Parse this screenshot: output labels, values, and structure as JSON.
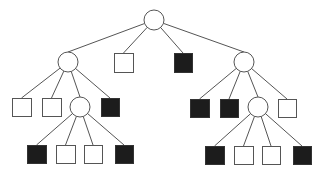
{
  "diagram": {
    "type": "tree",
    "colors": {
      "line": "#555555",
      "filled": "#1c1c1c",
      "empty": "#ffffff"
    },
    "nodes": [
      {
        "id": "root",
        "shape": "circle",
        "fill": "white",
        "cx": 154,
        "cy": 20,
        "r": 10
      },
      {
        "id": "L1a",
        "parent": "root",
        "shape": "circle",
        "fill": "white",
        "cx": 68,
        "cy": 62,
        "r": 10
      },
      {
        "id": "L1b",
        "parent": "root",
        "shape": "square",
        "fill": "white",
        "x": 114,
        "y": 53,
        "w": 19,
        "h": 19
      },
      {
        "id": "L1c",
        "parent": "root",
        "shape": "square",
        "fill": "black",
        "x": 174,
        "y": 53,
        "w": 18,
        "h": 19
      },
      {
        "id": "L1d",
        "parent": "root",
        "shape": "circle",
        "fill": "white",
        "cx": 244,
        "cy": 62,
        "r": 10
      },
      {
        "id": "L2a",
        "parent": "L1a",
        "shape": "square",
        "fill": "white",
        "x": 12,
        "y": 98,
        "w": 19,
        "h": 18
      },
      {
        "id": "L2b",
        "parent": "L1a",
        "shape": "square",
        "fill": "white",
        "x": 42,
        "y": 98,
        "w": 19,
        "h": 18
      },
      {
        "id": "L2c",
        "parent": "L1a",
        "shape": "circle",
        "fill": "white",
        "cx": 80,
        "cy": 107,
        "r": 10
      },
      {
        "id": "L2d",
        "parent": "L1a",
        "shape": "square",
        "fill": "black",
        "x": 101,
        "y": 98,
        "w": 18,
        "h": 18
      },
      {
        "id": "L2e",
        "parent": "L1d",
        "shape": "square",
        "fill": "black",
        "x": 190,
        "y": 99,
        "w": 19,
        "h": 18
      },
      {
        "id": "L2f",
        "parent": "L1d",
        "shape": "square",
        "fill": "black",
        "x": 220,
        "y": 99,
        "w": 18,
        "h": 18
      },
      {
        "id": "L2g",
        "parent": "L1d",
        "shape": "circle",
        "fill": "white",
        "cx": 258,
        "cy": 107,
        "r": 10
      },
      {
        "id": "L2h",
        "parent": "L1d",
        "shape": "square",
        "fill": "white",
        "x": 278,
        "y": 99,
        "w": 18,
        "h": 18
      },
      {
        "id": "L3a",
        "parent": "L2c",
        "shape": "square",
        "fill": "black",
        "x": 27,
        "y": 145,
        "w": 19,
        "h": 18
      },
      {
        "id": "L3b",
        "parent": "L2c",
        "shape": "square",
        "fill": "white",
        "x": 56,
        "y": 145,
        "w": 19,
        "h": 18
      },
      {
        "id": "L3c",
        "parent": "L2c",
        "shape": "square",
        "fill": "white",
        "x": 84,
        "y": 145,
        "w": 18,
        "h": 18
      },
      {
        "id": "L3d",
        "parent": "L2c",
        "shape": "square",
        "fill": "black",
        "x": 115,
        "y": 145,
        "w": 18,
        "h": 18
      },
      {
        "id": "L3e",
        "parent": "L2g",
        "shape": "square",
        "fill": "black",
        "x": 205,
        "y": 146,
        "w": 19,
        "h": 18
      },
      {
        "id": "L3f",
        "parent": "L2g",
        "shape": "square",
        "fill": "white",
        "x": 234,
        "y": 146,
        "w": 19,
        "h": 18
      },
      {
        "id": "L3g",
        "parent": "L2g",
        "shape": "square",
        "fill": "white",
        "x": 262,
        "y": 146,
        "w": 18,
        "h": 18
      },
      {
        "id": "L3h",
        "parent": "L2g",
        "shape": "square",
        "fill": "black",
        "x": 293,
        "y": 146,
        "w": 18,
        "h": 18
      }
    ]
  }
}
